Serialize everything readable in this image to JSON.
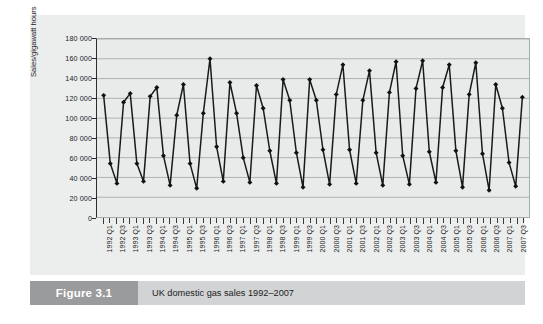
{
  "figure": {
    "number_label": "Figure 3.1",
    "caption": "UK domestic gas sales 1992–2007"
  },
  "colors": {
    "panel_background": "#eceded",
    "plot_background": "#e9eaea",
    "gridline": "#a8abad",
    "series_line": "#1a1a1a",
    "marker": "#111111",
    "caption_number_bg": "#9a9b9d",
    "caption_text_bg": "#d2d3d5",
    "axis": "#2c2c2c"
  },
  "chart_data": {
    "type": "line",
    "title": "",
    "subtitle": "",
    "xlabel": "",
    "ylabel": "Sales/gigawatt hours",
    "ylim": [
      0,
      180000
    ],
    "ytick_values": [
      0,
      20000,
      40000,
      60000,
      80000,
      100000,
      120000,
      140000,
      160000,
      180000
    ],
    "ytick_labels": [
      "0",
      "20 000",
      "40 000",
      "60 000",
      "80 000",
      "100 000",
      "120 000",
      "140 000",
      "160 000",
      "180 000"
    ],
    "grid": true,
    "grid_axis": "y",
    "legend": false,
    "legend_position": "none",
    "marker": "diamond",
    "categories": [
      "1992 Q1",
      "1992 Q2",
      "1992 Q3",
      "1992 Q4",
      "1993 Q1",
      "1993 Q2",
      "1993 Q3",
      "1993 Q4",
      "1994 Q1",
      "1994 Q2",
      "1994 Q3",
      "1994 Q4",
      "1995 Q1",
      "1995 Q2",
      "1995 Q3",
      "1995 Q4",
      "1996 Q1",
      "1996 Q2",
      "1996 Q3",
      "1996 Q4",
      "1997 Q1",
      "1997 Q2",
      "1997 Q3",
      "1997 Q4",
      "1998 Q1",
      "1998 Q2",
      "1998 Q3",
      "1998 Q4",
      "1999 Q1",
      "1999 Q2",
      "1999 Q3",
      "1999 Q4",
      "2000 Q1",
      "2000 Q2",
      "2000 Q3",
      "2000 Q4",
      "2001 Q1",
      "2001 Q2",
      "2001 Q3",
      "2001 Q4",
      "2002 Q1",
      "2002 Q2",
      "2002 Q3",
      "2002 Q4",
      "2003 Q1",
      "2003 Q2",
      "2003 Q3",
      "2003 Q4",
      "2004 Q1",
      "2004 Q2",
      "2004 Q3",
      "2004 Q4",
      "2005 Q1",
      "2005 Q2",
      "2005 Q3",
      "2005 Q4",
      "2006 Q1",
      "2006 Q2",
      "2006 Q3",
      "2006 Q4",
      "2007 Q1",
      "2007 Q2",
      "2007 Q3",
      "2007 Q4"
    ],
    "xtick_labels_shown": [
      "1992 Q1",
      "1992 Q3",
      "1993 Q1",
      "1993 Q3",
      "1994 Q1",
      "1994 Q3",
      "1995 Q1",
      "1995 Q3",
      "1996 Q1",
      "1996 Q3",
      "1997 Q1",
      "1997 Q3",
      "1998 Q1",
      "1998 Q3",
      "1999 Q1",
      "1999 Q3",
      "2000 Q1",
      "2000 Q3",
      "2001 Q1",
      "2001 Q3",
      "2002 Q1",
      "2002 Q3",
      "2003 Q1",
      "2003 Q3",
      "2004 Q1",
      "2004 Q3",
      "2005 Q1",
      "2005 Q3",
      "2006 Q1",
      "2006 Q3",
      "2007 Q1",
      "2007 Q3"
    ],
    "values": [
      123000,
      54000,
      34000,
      116000,
      125000,
      54000,
      36000,
      122000,
      131000,
      62000,
      32000,
      103000,
      134000,
      54000,
      29000,
      105000,
      160000,
      71000,
      36000,
      136000,
      105000,
      60000,
      35000,
      133000,
      110000,
      67000,
      34000,
      139000,
      118000,
      65000,
      30000,
      139000,
      118000,
      68000,
      33000,
      124000,
      154000,
      68000,
      34000,
      118000,
      148000,
      65000,
      32000,
      126000,
      157000,
      62000,
      33000,
      130000,
      158000,
      66000,
      35000,
      131000,
      154000,
      67000,
      30000,
      124000,
      156000,
      64000,
      27000,
      134000,
      110000,
      55000,
      31000,
      121000
    ]
  }
}
